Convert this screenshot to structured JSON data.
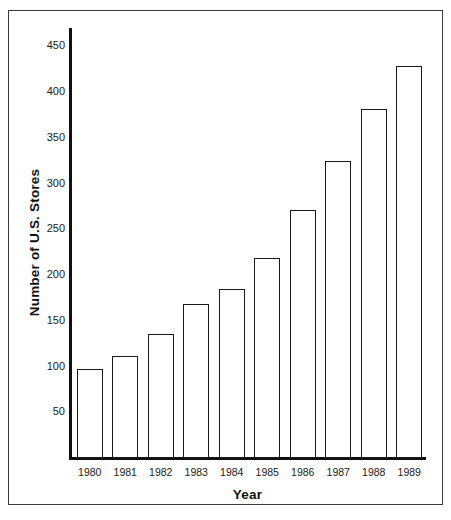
{
  "chart_data": {
    "type": "bar",
    "title": "",
    "xlabel": "Year",
    "ylabel": "Number of U.S. Stores",
    "categories": [
      "1980",
      "1981",
      "1982",
      "1983",
      "1984",
      "1985",
      "1986",
      "1987",
      "1988",
      "1989"
    ],
    "values": [
      97,
      112,
      135,
      168,
      185,
      219,
      271,
      325,
      381,
      428
    ],
    "series": [
      {
        "name": "Number of U.S. Stores",
        "values": [
          97,
          112,
          135,
          168,
          185,
          219,
          271,
          325,
          381,
          428
        ]
      }
    ],
    "ylim": [
      0,
      470
    ],
    "ytick_labels": [
      "450",
      "400",
      "350",
      "300",
      "250",
      "200",
      "150",
      "100",
      "50"
    ],
    "ytick_values": [
      450,
      400,
      350,
      300,
      250,
      200,
      150,
      100,
      50
    ],
    "grid": false,
    "legend": null,
    "legend_position": "none",
    "bar_fill_color": "#ffffff",
    "bar_edge_color": "#1a1a1a",
    "axis_color": "#111111",
    "background_color": "#ffffff",
    "frame_color": "#3a3a3a"
  },
  "axes": {
    "y_title": "Number of U.S. Stores",
    "x_title": "Year"
  }
}
